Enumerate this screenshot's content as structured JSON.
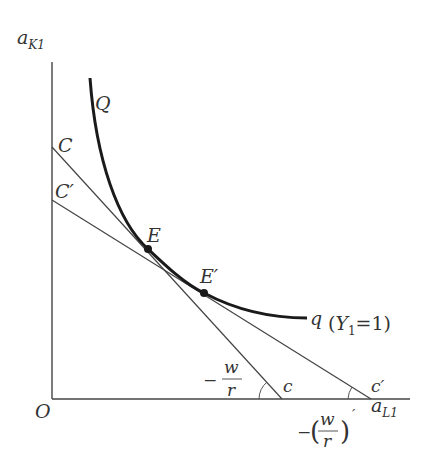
{
  "diagram": {
    "type": "isoquant-cost-line",
    "axes": {
      "y_label": "a",
      "y_sub": "K1",
      "x_label": "a",
      "x_sub": "L1",
      "origin": "O"
    },
    "curve": {
      "start_label": "Q",
      "end_label": "q",
      "annotation_open": "(",
      "annotation_var": "Y",
      "annotation_sub": "1",
      "annotation_eq": "=1)"
    },
    "lines": [
      {
        "top_label": "C",
        "bottom_label": "c",
        "slope_label_minus": "−",
        "slope_num": "w",
        "slope_den": "r"
      },
      {
        "top_label": "C′",
        "bottom_label": "c′",
        "slope_label_minus": "−",
        "slope_num": "w",
        "slope_den": "r",
        "slope_prime": "′"
      }
    ],
    "points": [
      {
        "label": "E"
      },
      {
        "label": "E′"
      }
    ]
  }
}
